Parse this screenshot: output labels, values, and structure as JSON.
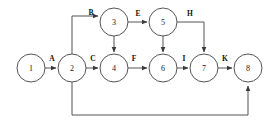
{
  "diagram": {
    "type": "activity-on-arrow-network",
    "canvas": {
      "width": 279,
      "height": 129,
      "background": "#ffffff"
    },
    "style": {
      "node_radius": 14,
      "node_fill": "#ffffff",
      "node_stroke": "#555555",
      "edge_stroke": "#555555",
      "label_color": "#111111"
    },
    "nodes": [
      {
        "id": "n1",
        "label": "1",
        "cx": 31,
        "cy": 68
      },
      {
        "id": "n2",
        "label": "2",
        "cx": 72,
        "cy": 68
      },
      {
        "id": "n3",
        "label": "3",
        "cx": 114,
        "cy": 22
      },
      {
        "id": "n4",
        "label": "4",
        "cx": 114,
        "cy": 68
      },
      {
        "id": "n5",
        "label": "5",
        "cx": 163,
        "cy": 22
      },
      {
        "id": "n6",
        "label": "6",
        "cx": 163,
        "cy": 68
      },
      {
        "id": "n7",
        "label": "7",
        "cx": 204,
        "cy": 68
      },
      {
        "id": "n8",
        "label": "8",
        "cx": 248,
        "cy": 68
      }
    ],
    "edges": [
      {
        "id": "e-A",
        "label": "A",
        "from": "n1",
        "to": "n2",
        "label_x": 52,
        "label_y": 58
      },
      {
        "id": "e-B",
        "label": "B",
        "from": "n2",
        "to": "n3",
        "label_x": 91,
        "label_y": 12
      },
      {
        "id": "e-C",
        "label": "C",
        "from": "n2",
        "to": "n4",
        "label_x": 93,
        "label_y": 58
      },
      {
        "id": "e-D",
        "label": "",
        "from": "n3",
        "to": "n4",
        "label_x": 0,
        "label_y": 0
      },
      {
        "id": "e-E",
        "label": "E",
        "from": "n3",
        "to": "n5",
        "label_x": 138,
        "label_y": 13
      },
      {
        "id": "e-F",
        "label": "F",
        "from": "n4",
        "to": "n6",
        "label_x": 134,
        "label_y": 58
      },
      {
        "id": "e-G",
        "label": "",
        "from": "n5",
        "to": "n6",
        "label_x": 0,
        "label_y": 0
      },
      {
        "id": "e-H",
        "label": "H",
        "from": "n5",
        "to": "n7",
        "label_x": 190,
        "label_y": 13
      },
      {
        "id": "e-I",
        "label": "I",
        "from": "n6",
        "to": "n7",
        "label_x": 184,
        "label_y": 58
      },
      {
        "id": "e-J",
        "label": "",
        "from": "n2",
        "to": "n8",
        "label_x": 0,
        "label_y": 0
      },
      {
        "id": "e-K",
        "label": "K",
        "from": "n7",
        "to": "n8",
        "label_x": 225,
        "label_y": 58
      }
    ]
  }
}
